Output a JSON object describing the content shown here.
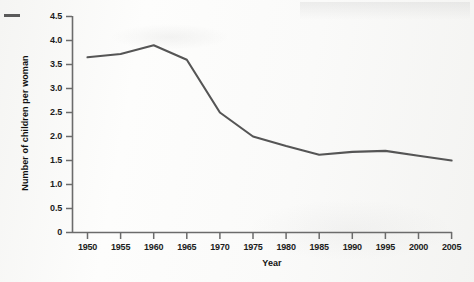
{
  "chart_data": {
    "type": "line",
    "title": "",
    "xlabel": "Year",
    "ylabel": "Number of children per woman",
    "x": [
      1950,
      1955,
      1960,
      1965,
      1970,
      1975,
      1980,
      1985,
      1990,
      1995,
      2000,
      2005
    ],
    "values": [
      3.65,
      3.72,
      3.9,
      3.6,
      2.5,
      2.0,
      1.8,
      1.62,
      1.68,
      1.7,
      1.6,
      1.5
    ],
    "series": [
      {
        "name": "Number of children per woman",
        "values": [
          3.65,
          3.72,
          3.9,
          3.6,
          2.5,
          2.0,
          1.8,
          1.62,
          1.68,
          1.7,
          1.6,
          1.5
        ]
      }
    ],
    "xlim": [
      1950,
      2005
    ],
    "ylim": [
      0,
      4.5
    ],
    "ytick_labels": [
      "4.5",
      "4.0",
      "3.5",
      "3.0",
      "2.5",
      "2.0",
      "1.5",
      "1.0",
      "0.5",
      "0"
    ],
    "ytick_values": [
      4.5,
      4.0,
      3.5,
      3.0,
      2.5,
      2.0,
      1.5,
      1.0,
      0.5,
      0
    ],
    "xtick_labels": [
      "1950",
      "1955",
      "1960",
      "1965",
      "1970",
      "1975",
      "1980",
      "1985",
      "1990",
      "1995",
      "2000",
      "2005"
    ],
    "grid": false,
    "legend": "none",
    "line_color": "#555555",
    "axis_color": "#6b6b6b",
    "text_color": "#1c1c1c"
  }
}
